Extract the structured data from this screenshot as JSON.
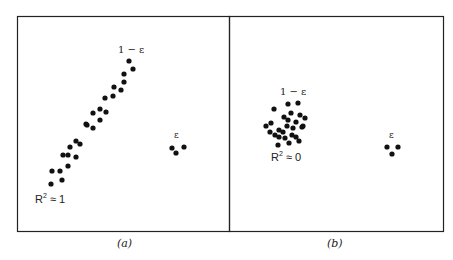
{
  "chart_data": [
    {
      "type": "scatter",
      "panel": "(a)",
      "title": "",
      "xlabel": "",
      "ylabel": "",
      "grid": false,
      "annotations": {
        "main_cluster_label": "1 − ε",
        "outlier_label": "ε",
        "fit_label": "R² ≈ 1"
      },
      "series": [
        {
          "name": "main cluster (1 − ε)",
          "points_px": [
            [
              129,
              61
            ],
            [
              133,
              69
            ],
            [
              124,
              74
            ],
            [
              124,
              82
            ],
            [
              121,
              90
            ],
            [
              114,
              87
            ],
            [
              113,
              96
            ],
            [
              105,
              98
            ],
            [
              106,
              112
            ],
            [
              100,
              109
            ],
            [
              93,
              113
            ],
            [
              100,
              120
            ],
            [
              87,
              125
            ],
            [
              93,
              128
            ],
            [
              86,
              124
            ],
            [
              80,
              144
            ],
            [
              76,
              141
            ],
            [
              70,
              147
            ],
            [
              76,
              157
            ],
            [
              68,
              155
            ],
            [
              63,
              155
            ],
            [
              68,
              166
            ],
            [
              60,
              171
            ],
            [
              52,
              171
            ],
            [
              62,
              180
            ],
            [
              51,
              184
            ]
          ]
        },
        {
          "name": "outliers (ε)",
          "points_px": [
            [
              172,
              148
            ],
            [
              184,
              147
            ],
            [
              176,
              153
            ]
          ]
        }
      ]
    },
    {
      "type": "scatter",
      "panel": "(b)",
      "title": "",
      "xlabel": "",
      "ylabel": "",
      "grid": false,
      "annotations": {
        "main_cluster_label": "1 − ε",
        "outlier_label": "ε",
        "fit_label": "R² ≈ 0"
      },
      "series": [
        {
          "name": "main cluster (1 − ε)",
          "points_px": [
            [
              274,
              109
            ],
            [
              288,
              104
            ],
            [
              298,
              103
            ],
            [
              291,
              113
            ],
            [
              300,
              115
            ],
            [
              284,
              117
            ],
            [
              271,
              123
            ],
            [
              279,
              130
            ],
            [
              287,
              126
            ],
            [
              296,
              122
            ],
            [
              305,
              118
            ],
            [
              283,
              132
            ],
            [
              292,
              135
            ],
            [
              303,
              126
            ],
            [
              270,
              132
            ],
            [
              279,
              137
            ],
            [
              289,
              143
            ],
            [
              296,
              137
            ],
            [
              278,
              145
            ],
            [
              299,
              141
            ],
            [
              275,
              135
            ],
            [
              302,
              127
            ],
            [
              285,
              138
            ],
            [
              293,
              128
            ],
            [
              266,
              126
            ],
            [
              288,
              120
            ]
          ]
        },
        {
          "name": "outliers (ε)",
          "points_px": [
            [
              387,
              147
            ],
            [
              398,
              147
            ],
            [
              392,
              154
            ]
          ]
        }
      ]
    }
  ],
  "figure": {
    "panels": [
      {
        "id": "a",
        "caption": "(a)",
        "label_main": "1 − ε",
        "label_outlier": "ε",
        "label_fit_base": "R",
        "label_fit_sup": "2",
        "label_fit_rest": " ≈ 1"
      },
      {
        "id": "b",
        "caption": "(b)",
        "label_main": "1 − ε",
        "label_outlier": "ε",
        "label_fit_base": "R",
        "label_fit_sup": "2",
        "label_fit_rest": " ≈ 0"
      }
    ],
    "colors": {
      "dot": "#111111",
      "frame": "#222222",
      "background": "#ffffff"
    }
  }
}
